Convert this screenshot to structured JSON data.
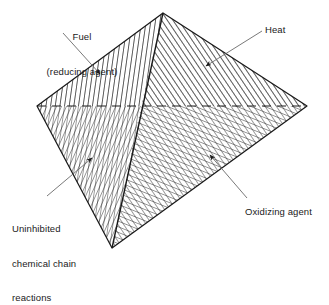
{
  "diagram": {
    "background_color": "#ffffff",
    "line_color": "#1a1a1a",
    "text_color": "#1a1a1a",
    "labels": {
      "fuel": {
        "line1": "Fuel",
        "line2": "(reducing agent)"
      },
      "heat": "Heat",
      "uninhibited": {
        "line1": "Uninhibited",
        "line2": "chemical chain",
        "line3": "reactions"
      },
      "oxidizing": "Oxidizing agent"
    },
    "geometry": {
      "apex": [
        163,
        13
      ],
      "left_vertex": [
        37,
        106
      ],
      "right_vertex": [
        307,
        106
      ],
      "bottom_vertex": [
        112,
        248
      ],
      "hidden_edge_style": "dashed",
      "faces": [
        {
          "name": "fuel-face",
          "hatch": "near-vertical",
          "label": "Fuel (reducing agent)"
        },
        {
          "name": "heat-face",
          "hatch": "diagonal-up-right-shallow",
          "label": "Heat"
        },
        {
          "name": "chain-reaction-face",
          "hatch": "diagonal-steep",
          "label": "Uninhibited chemical chain reactions"
        },
        {
          "name": "oxidizer-face",
          "hatch": "diagonal-up-right",
          "label": "Oxidizing agent"
        }
      ]
    },
    "leaders": [
      {
        "name": "fuel-leader",
        "from": [
          63,
          33
        ],
        "to": [
          100,
          74
        ]
      },
      {
        "name": "heat-leader",
        "from": [
          262,
          30
        ],
        "to": [
          206,
          66
        ]
      },
      {
        "name": "uninhibited-leader",
        "from": [
          47,
          196
        ],
        "to": [
          92,
          159
        ]
      },
      {
        "name": "oxidizing-leader",
        "from": [
          246,
          199
        ],
        "to": [
          210,
          155
        ]
      }
    ]
  }
}
